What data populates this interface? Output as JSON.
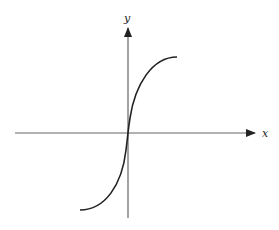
{
  "diagram": {
    "x_axis_label": "x",
    "y_axis_label": "y",
    "colors": {
      "axis": "#555555",
      "curve": "#222222",
      "label": "#222222",
      "background": "#ffffff"
    }
  }
}
